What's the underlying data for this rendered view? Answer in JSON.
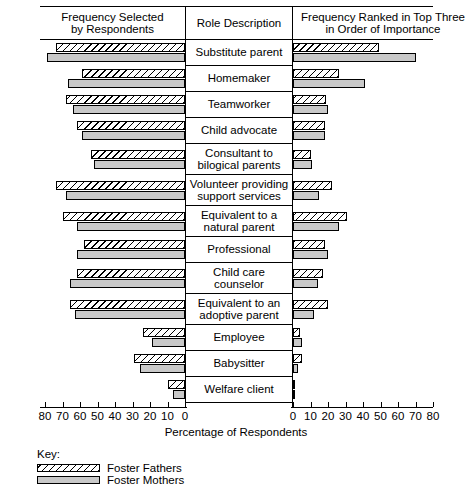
{
  "header": {
    "left_title": "Frequency Selected by Respondents",
    "left_title_l1": "Frequency Selected",
    "left_title_l2": "by Respondents",
    "mid_title": "Role Description",
    "right_title_l1": "Frequency Ranked in Top Three",
    "right_title_l2": "in Order of Importance"
  },
  "axis": {
    "title": "Percentage of Respondents",
    "left_ticks": [
      "80",
      "70",
      "60",
      "50",
      "40",
      "30",
      "20",
      "10",
      "0"
    ],
    "right_ticks": [
      "0",
      "10",
      "20",
      "30",
      "40",
      "50",
      "60",
      "70",
      "80"
    ],
    "max": 80,
    "left_min": 0,
    "left_max": 80
  },
  "legend": {
    "key_label": "Key:",
    "items": [
      {
        "label": "Foster Fathers",
        "pattern": "hatched",
        "color": "#ffffff"
      },
      {
        "label": "Foster Mothers",
        "pattern": "solid",
        "color": "#c9c9c9"
      }
    ]
  },
  "chart_data": {
    "type": "bar",
    "xlabel": "Percentage of Respondents",
    "ylabel": "Role Description",
    "orientation": "horizontal-bidirectional",
    "xlim_left": [
      80,
      0
    ],
    "xlim_right": [
      0,
      80
    ],
    "grid": false,
    "legend_position": "bottom-left",
    "series_names": [
      "Foster Fathers",
      "Foster Mothers"
    ],
    "categories": [
      "Substitute parent",
      "Homemaker",
      "Teamworker",
      "Child advocate",
      "Consultant to bilogical parents",
      "Volunteer providing support services",
      "Equivalent to a natural parent",
      "Professional",
      "Child care counselor",
      "Equivalent to an adoptive parent",
      "Employee",
      "Babysitter",
      "Welfare client"
    ],
    "panels": [
      {
        "name": "Frequency Selected by Respondents",
        "side": "left",
        "series": [
          {
            "name": "Foster Fathers",
            "values": [
              74,
              59,
              68,
              62,
              54,
              74,
              70,
              58,
              62,
              66,
              24,
              29,
              10
            ]
          },
          {
            "name": "Foster Mothers",
            "values": [
              79,
              67,
              64,
              59,
              52,
              68,
              62,
              62,
              66,
              63,
              19,
              26,
              7
            ]
          }
        ]
      },
      {
        "name": "Frequency Ranked in Top Three in Order of Importance",
        "side": "right",
        "series": [
          {
            "name": "Foster Fathers",
            "values": [
              49,
              26,
              19,
              18,
              10,
              22,
              31,
              18,
              17,
              20,
              4,
              5,
              1
            ]
          },
          {
            "name": "Foster Mothers",
            "values": [
              70,
              41,
              20,
              18,
              11,
              15,
              26,
              20,
              14,
              12,
              5,
              3,
              1
            ]
          }
        ]
      }
    ]
  }
}
